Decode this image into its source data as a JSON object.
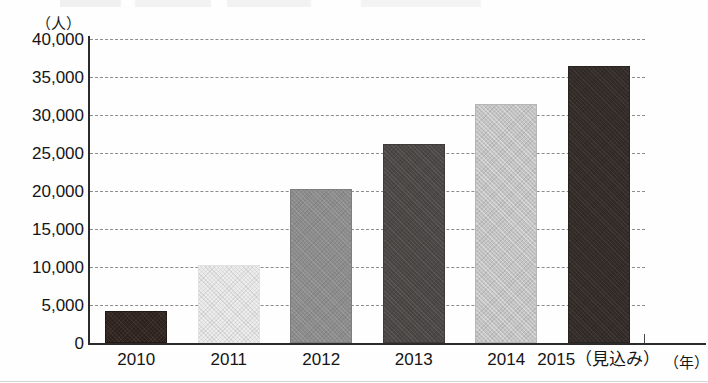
{
  "figure": {
    "unit_label_y": "（人）",
    "unit_label_x": "（年）"
  },
  "chart_data": {
    "type": "bar",
    "title": "",
    "xlabel": "（年）",
    "ylabel": "（人）",
    "ylim": [
      0,
      40000
    ],
    "ytick_labels": [
      "40,000",
      "35,000",
      "30,000",
      "25,000",
      "20,000",
      "15,000",
      "10,000",
      "5,000",
      "0"
    ],
    "ytick_values": [
      40000,
      35000,
      30000,
      25000,
      20000,
      15000,
      10000,
      5000,
      0
    ],
    "grid": true,
    "grid_style": "dashed-horizontal",
    "legend": "none",
    "categories": [
      "2010",
      "2011",
      "2012",
      "2013",
      "2014",
      "2015（見込み）"
    ],
    "values": [
      4200,
      10300,
      20300,
      26200,
      31400,
      36400
    ],
    "bars": [
      {
        "category": "2010",
        "value": 4200,
        "fill": "dark-brown",
        "color": "#2d211c"
      },
      {
        "category": "2011",
        "value": 10300,
        "fill": "very-light-gray",
        "color": "#ededed"
      },
      {
        "category": "2012",
        "value": 20300,
        "fill": "mid-gray",
        "color": "#8c8c8c"
      },
      {
        "category": "2013",
        "value": 26200,
        "fill": "dark-gray",
        "color": "#4b4745"
      },
      {
        "category": "2014",
        "value": 31400,
        "fill": "light-gray",
        "color": "#c3c3c3"
      },
      {
        "category": "2015（見込み）",
        "value": 36400,
        "fill": "darkest",
        "color": "#332c29"
      }
    ]
  }
}
